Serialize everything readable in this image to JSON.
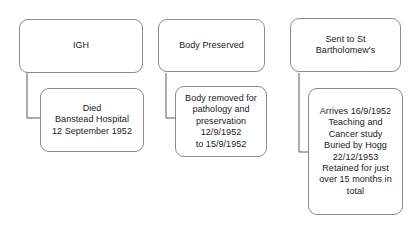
{
  "diagram": {
    "type": "flowchart",
    "background_color": "#ffffff",
    "box_border_color": "#8a8a8a",
    "connector_color": "#5a5a5a",
    "text_color": "#1a1a1a",
    "columns": [
      {
        "id": "column-1",
        "header_node": {
          "id": "igh",
          "label": "IGH"
        },
        "detail_node": {
          "id": "died",
          "label": "Died\nBanstead Hospital\n12 September 1952",
          "lines": [
            "Died",
            "Banstead Hospital",
            "12 September 1952"
          ]
        }
      },
      {
        "id": "column-2",
        "header_node": {
          "id": "body-preserved",
          "label": "Body Preserved"
        },
        "detail_node": {
          "id": "body-removed",
          "label": "Body removed for\npathology and\npreservation\n12/9/1952\nto 15/9/1952",
          "lines": [
            "Body removed for",
            "pathology and",
            "preservation",
            "12/9/1952",
            "to 15/9/1952"
          ]
        }
      },
      {
        "id": "column-3",
        "header_node": {
          "id": "sent-to-st-barts",
          "label": "Sent to St\nBartholomew's",
          "lines": [
            "Sent to St",
            "Bartholomew's"
          ]
        },
        "detail_node": {
          "id": "arrives",
          "label": "Arrives 16/9/1952\nTeaching and\nCancer study\nBuried by Hogg\n22/12/1953\nRetained for just\nover 15 months in\ntotal",
          "lines": [
            "Arrives 16/9/1952",
            "Teaching and",
            "Cancer study",
            "Buried by Hogg",
            "22/12/1953",
            "Retained for just",
            "over 15 months in",
            "total"
          ]
        }
      }
    ],
    "connectors": [
      {
        "id": "connector-1",
        "from": "igh",
        "to": "died",
        "path": "elbow-down-right"
      },
      {
        "id": "connector-2",
        "from": "body-preserved",
        "to": "body-removed",
        "path": "elbow-down-right"
      },
      {
        "id": "connector-3",
        "from": "sent-to-st-barts",
        "to": "arrives",
        "path": "elbow-down-right"
      }
    ]
  }
}
